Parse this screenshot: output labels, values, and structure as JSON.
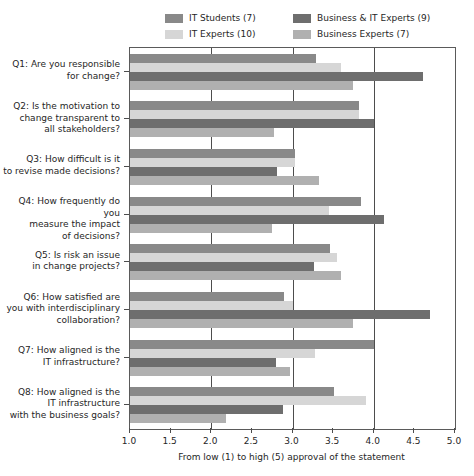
{
  "chart_data": {
    "type": "bar",
    "orientation": "horizontal",
    "title": "",
    "subtitle": "",
    "xlabel": "From low (1) to high (5) approval of the statement",
    "ylabel": "",
    "xlim": [
      1.0,
      5.0
    ],
    "xticks": [
      "1.0",
      "1.5",
      "2.0",
      "2.5",
      "3.0",
      "3.5",
      "4.0",
      "4.5",
      "5.0"
    ],
    "xtick_values": [
      1.0,
      1.5,
      2.0,
      2.5,
      3.0,
      3.5,
      4.0,
      4.5,
      5.0
    ],
    "grid": "vertical gridlines at 2.0, 3.0, 4.0",
    "gridline_values": [
      2.0,
      3.0,
      4.0
    ],
    "legend_position": "top-center",
    "categories": [
      "Q1: Are you responsible\nfor change?",
      "Q2: Is the motivation to\nchange transparent to\nall stakeholders?",
      "Q3: How difficult is it\nto revise made decisions?",
      "Q4: How frequently do you\nmeasure the impact\nof decisions?",
      "Q5: Is risk an issue\nin change projects?",
      "Q6: How satisfied are\nyou with interdisciplinary\ncollaboration?",
      "Q7: How aligned is the\nIT infrastructure?",
      "Q8: How aligned is the\nIT infrastructure\nwith the business goals?"
    ],
    "series": [
      {
        "name": "IT Students (7)",
        "color": "#898989",
        "values": [
          3.29,
          3.82,
          3.03,
          3.84,
          3.46,
          2.9,
          4.0,
          3.51
        ]
      },
      {
        "name": "IT Experts (10)",
        "color": "#d6d6d6",
        "values": [
          3.6,
          3.82,
          3.03,
          3.45,
          3.55,
          3.01,
          3.28,
          3.9
        ]
      },
      {
        "name": "Business & IT Experts (9)",
        "color": "#6e6e6e",
        "values": [
          4.6,
          4.0,
          2.81,
          4.13,
          3.27,
          4.69,
          2.8,
          2.88
        ]
      },
      {
        "name": "Business Experts (7)",
        "color": "#b0b0b0",
        "values": [
          3.75,
          2.77,
          3.33,
          2.75,
          3.6,
          3.74,
          2.97,
          2.18
        ]
      }
    ]
  },
  "legend": {
    "entries": [
      {
        "label": "IT Students (7)",
        "color": "#898989"
      },
      {
        "label": "Business & IT Experts (9)",
        "color": "#6e6e6e"
      },
      {
        "label": "IT Experts (10)",
        "color": "#d6d6d6"
      },
      {
        "label": "Business Experts (7)",
        "color": "#b0b0b0"
      }
    ]
  },
  "axis": {
    "x_title": "From low (1) to high (5) approval of the statement",
    "x_tick_labels": [
      "1.0",
      "1.5",
      "2.0",
      "2.5",
      "3.0",
      "3.5",
      "4.0",
      "4.5",
      "5.0"
    ]
  },
  "y_categories": [
    {
      "lines": [
        "Q1: Are you responsible",
        "for change?"
      ]
    },
    {
      "lines": [
        "Q2: Is the motivation to",
        "change transparent to",
        "all stakeholders?"
      ]
    },
    {
      "lines": [
        "Q3: How difficult is it",
        "to revise made decisions?"
      ]
    },
    {
      "lines": [
        "Q4: How frequently do you",
        "measure the impact",
        "of decisions?"
      ]
    },
    {
      "lines": [
        "Q5: Is risk an issue",
        "in change projects?"
      ]
    },
    {
      "lines": [
        "Q6: How satisfied are",
        "you with interdisciplinary",
        "collaboration?"
      ]
    },
    {
      "lines": [
        "Q7: How aligned is the",
        "IT infrastructure?"
      ]
    },
    {
      "lines": [
        "Q8: How aligned is the",
        "IT infrastructure",
        "with the business goals?"
      ]
    }
  ]
}
